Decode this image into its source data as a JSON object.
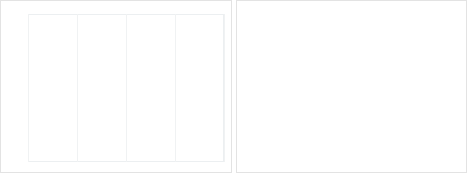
{
  "figure": {
    "panels": [
      "left",
      "right"
    ],
    "background": "#ffffff",
    "border_color": "#e3e3e3"
  },
  "chart_data": [
    {
      "id": "left",
      "type": "line",
      "title": "",
      "xlabel": "",
      "ylabel": "",
      "xlim": [
        80,
        120
      ],
      "ylim": [
        -15,
        20
      ],
      "xticks": [
        80,
        90,
        100,
        110,
        120
      ],
      "yticks": [
        20,
        15,
        10,
        5,
        0,
        -5,
        -10,
        -15
      ],
      "grid": true,
      "grid_axis": "x",
      "legend_position": "top-right",
      "x": [
        80,
        82,
        84,
        86,
        88,
        90,
        92,
        94,
        95,
        96,
        98,
        100,
        101,
        102,
        103,
        104,
        105,
        106,
        107,
        108,
        110,
        112,
        114,
        116,
        118,
        120
      ],
      "series": [
        {
          "name": "Spot theta",
          "color": "#6b7b8c",
          "values": [
            0.4,
            0.5,
            0.7,
            1.0,
            1.6,
            2.5,
            3.9,
            5.6,
            6.6,
            7.7,
            10.3,
            13.6,
            15.0,
            16.2,
            16.5,
            16.2,
            15.0,
            13.0,
            10.5,
            7.8,
            3.6,
            1.3,
            0.5,
            0.2,
            0.1,
            0.05
          ]
        },
        {
          "name": "Cross theta",
          "color": "#8d9aa6",
          "values": [
            0.3,
            0.4,
            0.6,
            0.9,
            1.4,
            2.1,
            3.1,
            4.1,
            4.4,
            4.3,
            3.0,
            0.2,
            -2.0,
            -4.3,
            -6.5,
            -8.3,
            -9.6,
            -10.3,
            -10.0,
            -8.7,
            -4.9,
            -1.7,
            -0.5,
            -0.2,
            -0.1,
            -0.05
          ]
        },
        {
          "name": "Vol theta",
          "color": "#cbd2d8",
          "values": [
            0.1,
            0.15,
            0.2,
            0.3,
            0.5,
            0.7,
            1.0,
            1.2,
            1.3,
            1.3,
            1.2,
            1.3,
            1.6,
            2.1,
            2.7,
            3.3,
            3.7,
            3.9,
            3.9,
            3.5,
            2.1,
            0.8,
            0.3,
            0.1,
            0.05,
            0.02
          ]
        }
      ]
    },
    {
      "id": "right",
      "type": "line",
      "title": "",
      "xlabel": "",
      "ylabel": "",
      "xlim": [
        80,
        120
      ],
      "ylim": [
        0,
        16
      ],
      "xticks": [
        80,
        90,
        100,
        110,
        120
      ],
      "yticks": [
        16,
        14,
        12,
        10,
        8,
        6,
        4,
        2,
        0
      ],
      "grid": true,
      "grid_axis": "x",
      "legend_position": "top-right",
      "x": [
        80,
        82,
        84,
        86,
        88,
        90,
        92,
        94,
        96,
        97,
        98,
        99,
        100,
        101,
        102,
        104,
        106,
        108,
        110,
        112,
        114,
        116,
        118,
        120
      ],
      "series": [
        {
          "name": "Sum of 3 thetas",
          "color": "#6b7b8c",
          "values": [
            1.7,
            2.1,
            2.7,
            3.4,
            4.4,
            5.6,
            7.3,
            9.4,
            12.0,
            13.0,
            13.6,
            13.8,
            13.7,
            13.1,
            12.1,
            9.0,
            5.6,
            2.9,
            1.2,
            0.4,
            0.2,
            0.1,
            0.1,
            0.1
          ]
        },
        {
          "name": "Black-Scholes theta",
          "color": "#b9c1c8",
          "values": [
            2.6,
            3.1,
            3.7,
            4.5,
            5.5,
            6.8,
            8.4,
            10.3,
            12.5,
            13.3,
            13.8,
            13.9,
            13.6,
            12.9,
            11.8,
            8.7,
            5.3,
            2.7,
            1.1,
            0.4,
            0.2,
            0.1,
            0.1,
            0.1
          ]
        }
      ]
    }
  ],
  "left_chart": {
    "ytick_labels": [
      "20",
      "15",
      "10",
      "5",
      "0",
      "-5",
      "-10",
      "-15"
    ],
    "xtick_labels": [
      "80",
      "90",
      "100",
      "110",
      "120"
    ],
    "legend": [
      {
        "label": "Spot theta",
        "color": "#6b7b8c"
      },
      {
        "label": "Cross theta",
        "color": "#8d9aa6"
      },
      {
        "label": "Vol theta",
        "color": "#cbd2d8"
      }
    ]
  },
  "right_chart": {
    "ytick_labels": [
      "16",
      "14",
      "12",
      "10",
      "8",
      "6",
      "4",
      "2",
      "0"
    ],
    "xtick_labels": [
      "80",
      "90",
      "100",
      "110",
      "120"
    ],
    "legend": [
      {
        "label": "Sum of 3 thetas",
        "color": "#6b7b8c"
      },
      {
        "label": "Black-Scholes theta",
        "color": "#b9c1c8"
      }
    ]
  }
}
